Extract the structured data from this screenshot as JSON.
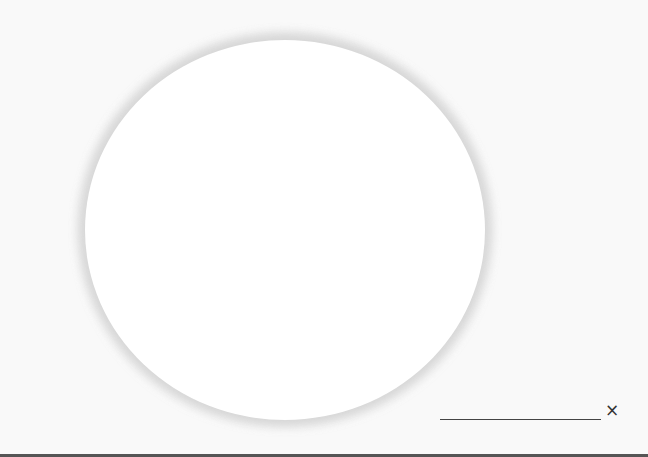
{
  "canvas": {
    "background_color": "#f9f9f9",
    "circle_color": "#ffffff",
    "shadow_color": "#e6e6e6"
  },
  "input": {
    "value": "",
    "placeholder": ""
  },
  "close_button": {
    "icon": "close-icon",
    "glyph": "×"
  },
  "bottom_bar": {
    "color": "#555555"
  }
}
